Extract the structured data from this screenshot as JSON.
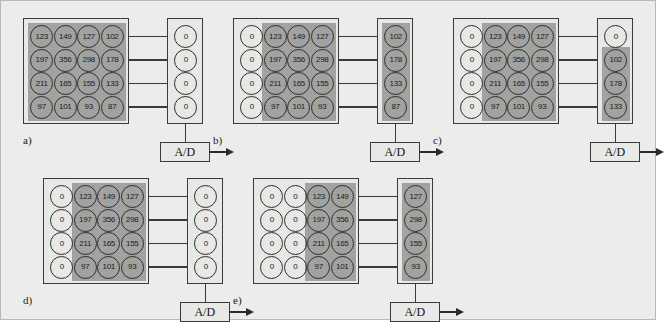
{
  "figure": {
    "background_color": "#ececeb",
    "shade_color": "#a2a2a1",
    "box_color": "#e8e8e7",
    "line_color": "#3a3a3a"
  },
  "labels": {
    "ad_converter": "A/D",
    "zero": "0"
  },
  "panels": [
    {
      "id": "a",
      "caption": "a)",
      "grid": {
        "rows": 4,
        "cols": 4,
        "values": [
          [
            "123",
            "149",
            "127",
            "102"
          ],
          [
            "197",
            "356",
            "298",
            "178"
          ],
          [
            "211",
            "165",
            "155",
            "133"
          ],
          [
            "97",
            "101",
            "93",
            "87"
          ]
        ],
        "shaded_cols": [
          0,
          1,
          2,
          3
        ]
      },
      "register": {
        "values": [
          "0",
          "0",
          "0",
          "0"
        ],
        "shaded_rows": []
      }
    },
    {
      "id": "b",
      "caption": "b)",
      "grid": {
        "rows": 4,
        "cols": 4,
        "values": [
          [
            "0",
            "123",
            "149",
            "127"
          ],
          [
            "0",
            "197",
            "356",
            "298"
          ],
          [
            "0",
            "211",
            "165",
            "155"
          ],
          [
            "0",
            "97",
            "101",
            "93"
          ]
        ],
        "shaded_cols": [
          1,
          2,
          3
        ]
      },
      "register": {
        "values": [
          "102",
          "178",
          "133",
          "87"
        ],
        "shaded_rows": [
          0,
          1,
          2,
          3
        ]
      }
    },
    {
      "id": "c",
      "caption": "c)",
      "grid": {
        "rows": 4,
        "cols": 4,
        "values": [
          [
            "0",
            "123",
            "149",
            "127"
          ],
          [
            "0",
            "197",
            "356",
            "298"
          ],
          [
            "0",
            "211",
            "165",
            "155"
          ],
          [
            "0",
            "97",
            "101",
            "93"
          ]
        ],
        "shaded_cols": [
          1,
          2,
          3
        ]
      },
      "register": {
        "values": [
          "0",
          "102",
          "178",
          "133"
        ],
        "shaded_rows": [
          1,
          2,
          3
        ]
      }
    },
    {
      "id": "d",
      "caption": "d)",
      "grid": {
        "rows": 4,
        "cols": 4,
        "values": [
          [
            "0",
            "123",
            "149",
            "127"
          ],
          [
            "0",
            "197",
            "356",
            "298"
          ],
          [
            "0",
            "211",
            "165",
            "155"
          ],
          [
            "0",
            "97",
            "101",
            "93"
          ]
        ],
        "shaded_cols": [
          1,
          2,
          3
        ]
      },
      "register": {
        "values": [
          "0",
          "0",
          "0",
          "0"
        ],
        "shaded_rows": []
      }
    },
    {
      "id": "e",
      "caption": "e)",
      "grid": {
        "rows": 4,
        "cols": 4,
        "values": [
          [
            "0",
            "0",
            "123",
            "149"
          ],
          [
            "0",
            "0",
            "197",
            "356"
          ],
          [
            "0",
            "0",
            "211",
            "165"
          ],
          [
            "0",
            "0",
            "97",
            "101"
          ]
        ],
        "shaded_cols": [
          2,
          3
        ]
      },
      "register": {
        "values": [
          "127",
          "298",
          "155",
          "93"
        ],
        "shaded_rows": [
          0,
          1,
          2,
          3
        ]
      }
    }
  ]
}
